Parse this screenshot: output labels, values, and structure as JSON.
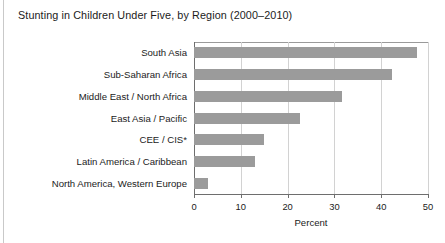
{
  "chart_data": {
    "type": "bar",
    "orientation": "horizontal",
    "title": "Stunting in Children Under Five, by Region (2000–2010)",
    "xlabel": "Percent",
    "ylabel": "",
    "categories": [
      "South Asia",
      "Sub-Saharan Africa",
      "Middle East / North Africa",
      "East Asia / Pacific",
      "CEE / CIS*",
      "Latin America / Caribbean",
      "North America, Western Europe"
    ],
    "values": [
      47.6,
      42.4,
      31.6,
      22.6,
      15.0,
      13.0,
      3.0
    ],
    "xlim": [
      0,
      50
    ],
    "xticks": [
      0,
      10,
      20,
      30,
      40,
      50
    ],
    "xtick_labels": [
      "0",
      "10",
      "20",
      "30",
      "40",
      "50"
    ],
    "grid": true,
    "legend": false,
    "bar_color": "#9b9b9b",
    "background_color": "#ffffff"
  },
  "figure": {
    "title": "Stunting in Children Under Five, by Region (2000–2010)",
    "axis_title": "Percent"
  }
}
